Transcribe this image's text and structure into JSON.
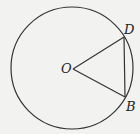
{
  "diagram": {
    "type": "geometry-circle",
    "labels": {
      "center": "O",
      "point_d": "D",
      "point_b": "B"
    },
    "colors": {
      "background": "#f2f2f0",
      "stroke": "#333333"
    }
  }
}
